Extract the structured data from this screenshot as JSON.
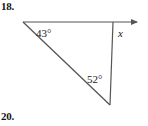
{
  "figure": {
    "problem_number": "18.",
    "next_problem_number": "20.",
    "background_color": "#ffffff",
    "stroke_color": "#555555",
    "text_color": "#202020",
    "number_color": "#151515"
  },
  "labels": {
    "angle_top_left": "43°",
    "angle_bottom": "52°",
    "unknown_angle": "x"
  },
  "geometry": {
    "type": "triangle-with-ray",
    "vertices": {
      "left_apex": {
        "x": 23,
        "y": 22
      },
      "top_right": {
        "x": 113,
        "y": 22
      },
      "bottom": {
        "x": 110,
        "y": 105
      }
    },
    "ray": {
      "from": {
        "x": 23,
        "y": 22
      },
      "to": {
        "x": 144,
        "y": 22
      },
      "arrowhead_at": "right"
    },
    "stroke_width": 1.2
  }
}
